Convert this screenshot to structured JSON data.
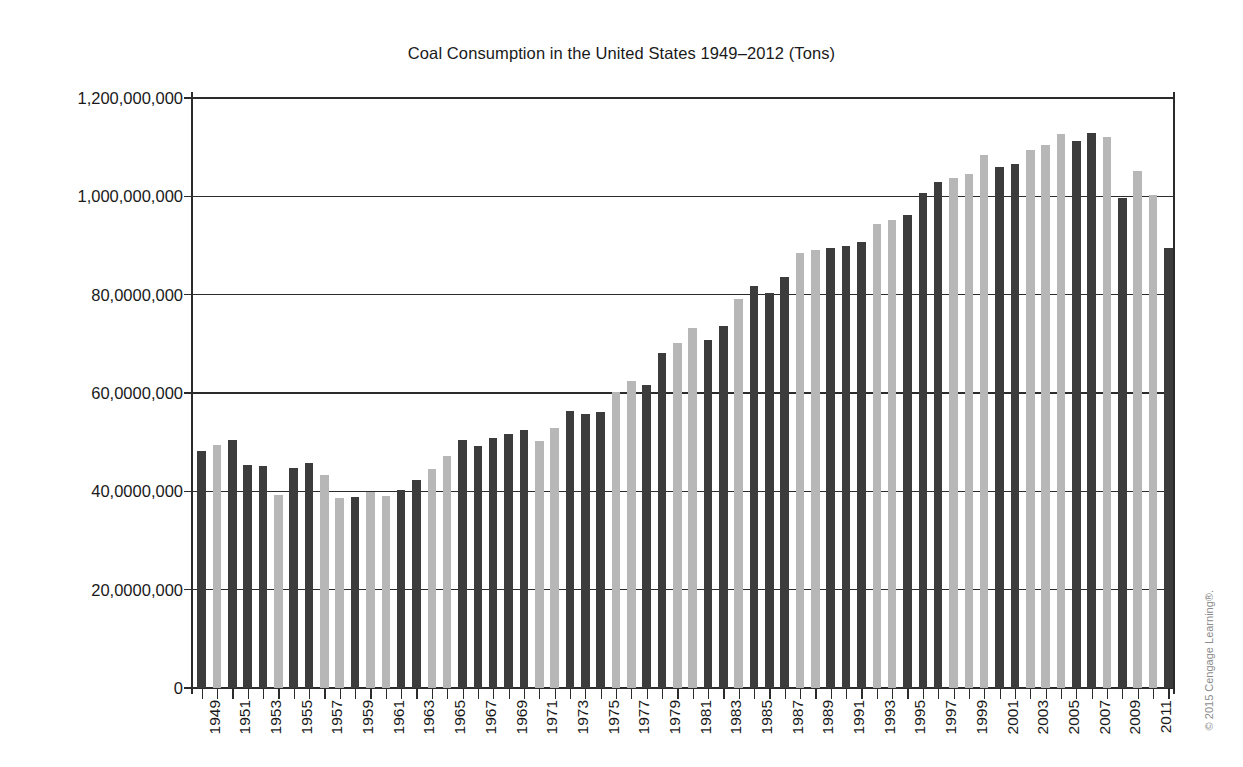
{
  "chart_data": {
    "type": "bar",
    "title": "Coal Consumption in the United States 1949–2012 (Tons)",
    "xlabel": "",
    "ylabel": "",
    "ylim": [
      0,
      1200000000
    ],
    "grid": true,
    "legend": null,
    "ytick_labels": [
      "1,200,000,000",
      "1,000,000,000",
      "80,0000,000",
      "60,0000,000",
      "40,0000,000",
      "20,0000,000",
      "0"
    ],
    "ytick_values": [
      1200000000,
      1000000000,
      800000000,
      600000000,
      400000000,
      200000000,
      0
    ],
    "xtick_labels": [
      "1949",
      "1951",
      "1953",
      "1955",
      "1957",
      "1959",
      "1961",
      "1963",
      "1965",
      "1967",
      "1969",
      "1971",
      "1973",
      "1975",
      "1977",
      "1979",
      "1981",
      "1983",
      "1985",
      "1987",
      "1989",
      "1991",
      "1993",
      "1995",
      "1997",
      "1999",
      "2001",
      "2003",
      "2005",
      "2007",
      "2009",
      "2011"
    ],
    "categories": [
      1949,
      1950,
      1951,
      1952,
      1953,
      1954,
      1955,
      1956,
      1957,
      1958,
      1959,
      1960,
      1961,
      1962,
      1963,
      1964,
      1965,
      1966,
      1967,
      1968,
      1969,
      1970,
      1971,
      1972,
      1973,
      1974,
      1975,
      1976,
      1977,
      1978,
      1979,
      1980,
      1981,
      1982,
      1983,
      1984,
      1985,
      1986,
      1987,
      1988,
      1989,
      1990,
      1991,
      1992,
      1993,
      1994,
      1995,
      1996,
      1997,
      1998,
      1999,
      2000,
      2001,
      2002,
      2003,
      2004,
      2005,
      2006,
      2007,
      2008,
      2009,
      2010,
      2011,
      2012
    ],
    "values": [
      483000000,
      495000000,
      505000000,
      454000000,
      452000000,
      392000000,
      447000000,
      458000000,
      433000000,
      387000000,
      389000000,
      398000000,
      391000000,
      402000000,
      424000000,
      446000000,
      472000000,
      505000000,
      492000000,
      509000000,
      517000000,
      524000000,
      502000000,
      528000000,
      563000000,
      558000000,
      562000000,
      603000000,
      625000000,
      616000000,
      681000000,
      702000000,
      732000000,
      707000000,
      737000000,
      792000000,
      818000000,
      804000000,
      836000000,
      884000000,
      890000000,
      895000000,
      900000000,
      907000000,
      944000000,
      951000000,
      962000000,
      1006000000,
      1030000000,
      1037000000,
      1045000000,
      1084000000,
      1060000000,
      1066000000,
      1094000000,
      1104000000,
      1126000000,
      1112000000,
      1128000000,
      1120000000,
      997000000,
      1051000000,
      1003000000,
      895000000
    ],
    "bar_colors_alternating": [
      "#3c3c3c",
      "#b7b7b7"
    ],
    "dark_color": "#3c3c3c",
    "light_color": "#b7b7b7",
    "bar_shades": [
      "dark",
      "light",
      "dark",
      "dark",
      "dark",
      "light",
      "dark",
      "dark",
      "light",
      "light",
      "dark",
      "light",
      "light",
      "dark",
      "dark",
      "light",
      "light",
      "dark",
      "dark",
      "dark",
      "dark",
      "dark",
      "light",
      "light",
      "dark",
      "dark",
      "dark",
      "light",
      "light",
      "dark",
      "dark",
      "light",
      "light",
      "dark",
      "dark",
      "light",
      "dark",
      "dark",
      "dark",
      "light",
      "light",
      "dark",
      "dark",
      "dark",
      "light",
      "light",
      "dark",
      "dark",
      "dark",
      "light",
      "light",
      "light",
      "dark",
      "dark",
      "light",
      "light",
      "light",
      "dark",
      "dark",
      "light",
      "dark",
      "light",
      "light",
      "dark"
    ]
  },
  "footer": {
    "copyright": "© 2015 Cengage Learning®."
  }
}
